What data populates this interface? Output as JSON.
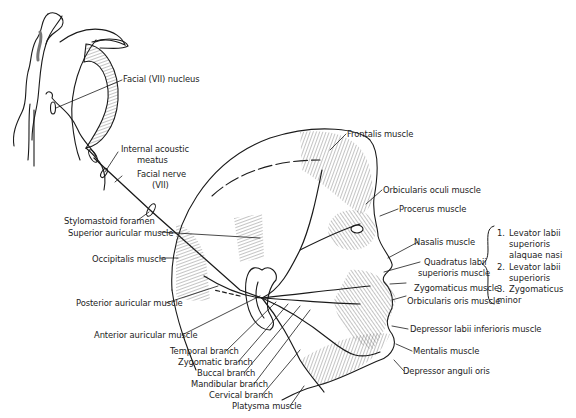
{
  "figure": {
    "labels": {
      "facial_nucleus": "Facial (VII) nucleus",
      "internal_acoustic_meatus_1": "Internal acoustic",
      "internal_acoustic_meatus_2": "meatus",
      "facial_nerve_1": "Facial nerve",
      "facial_nerve_2": "(VII)",
      "stylomastoid_foramen": "Stylomastoid foramen",
      "superior_auricular": "Superior auricular muscle",
      "occipitalis": "Occipitalis muscle",
      "posterior_auricular": "Posterior auricular muscle",
      "anterior_auricular": "Anterior auricular muscle",
      "temporal_branch": "Temporal branch",
      "zygomatic_branch": "Zygomatic branch",
      "buccal_branch": "Buccal branch",
      "mandibular_branch": "Mandibular branch",
      "cervical_branch": "Cervical branch",
      "platysma": "Platysma muscle",
      "frontalis": "Frontalis muscle",
      "orbicularis_oculi": "Orbicularis oculi muscle",
      "procerus": "Procerus muscle",
      "nasalis": "Nasalis muscle",
      "quadratus_1": "Quadratus labii",
      "quadratus_2": "superioris muscle",
      "zygomaticus": "Zygomaticus muscle",
      "orbicularis_oris": "Orbicularis oris muscle",
      "depressor_labii": "Depressor labii inferioris muscle",
      "mentalis": "Mentalis muscle",
      "depressor_anguli": "Depressor anguli oris"
    },
    "quadratus_parts": [
      {
        "num": "1.",
        "lines": [
          "Levator labii",
          "superioris",
          "alaquae nasi"
        ]
      },
      {
        "num": "2.",
        "lines": [
          "Levator labii",
          "superioris"
        ]
      },
      {
        "num": "3.",
        "lines": [
          "Zygomaticus minor"
        ]
      }
    ],
    "colors": {
      "ink": "#1a1a1a",
      "background": "#ffffff"
    }
  }
}
